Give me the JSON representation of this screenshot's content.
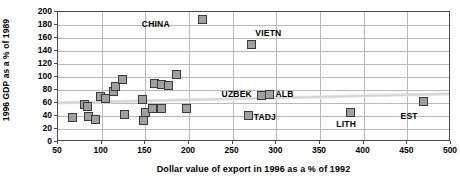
{
  "chart_data": {
    "type": "scatter",
    "title": "",
    "xlabel": "Dollar value of export in 1996 as a % of 1992",
    "ylabel": "1996 GDP as a % of 1989",
    "xlim": [
      50,
      500
    ],
    "ylim": [
      0,
      200
    ],
    "xticks": [
      50,
      100,
      150,
      200,
      250,
      300,
      350,
      400,
      450,
      500
    ],
    "yticks": [
      0,
      20,
      40,
      60,
      80,
      100,
      120,
      140,
      160,
      180,
      200
    ],
    "grid": true,
    "legend": "none",
    "marker": {
      "shape": "square",
      "fill": "#a0a0a0",
      "edge": "#3a3a3a",
      "size": 9
    },
    "points": [
      {
        "x": 67,
        "y": 38,
        "label": ""
      },
      {
        "x": 80,
        "y": 58,
        "label": ""
      },
      {
        "x": 84,
        "y": 54,
        "label": ""
      },
      {
        "x": 85,
        "y": 39,
        "label": ""
      },
      {
        "x": 93,
        "y": 35,
        "label": ""
      },
      {
        "x": 99,
        "y": 70,
        "label": ""
      },
      {
        "x": 104,
        "y": 67,
        "label": ""
      },
      {
        "x": 113,
        "y": 78,
        "label": ""
      },
      {
        "x": 116,
        "y": 85,
        "label": ""
      },
      {
        "x": 124,
        "y": 96,
        "label": ""
      },
      {
        "x": 126,
        "y": 42,
        "label": ""
      },
      {
        "x": 147,
        "y": 65,
        "label": ""
      },
      {
        "x": 148,
        "y": 33,
        "label": ""
      },
      {
        "x": 150,
        "y": 45,
        "label": ""
      },
      {
        "x": 158,
        "y": 51,
        "label": ""
      },
      {
        "x": 161,
        "y": 90,
        "label": ""
      },
      {
        "x": 168,
        "y": 88,
        "label": ""
      },
      {
        "x": 169,
        "y": 52,
        "label": ""
      },
      {
        "x": 176,
        "y": 87,
        "label": ""
      },
      {
        "x": 186,
        "y": 104,
        "label": ""
      },
      {
        "x": 197,
        "y": 52,
        "label": ""
      },
      {
        "x": 215,
        "y": 188,
        "label": "CHINA"
      },
      {
        "x": 268,
        "y": 41,
        "label": "TADJ"
      },
      {
        "x": 272,
        "y": 150,
        "label": "VIETN"
      },
      {
        "x": 283,
        "y": 71,
        "label": "UZBEK"
      },
      {
        "x": 292,
        "y": 73,
        "label": "ALB"
      },
      {
        "x": 385,
        "y": 45,
        "label": "LITH"
      },
      {
        "x": 468,
        "y": 62,
        "label": "EST"
      }
    ],
    "annotations": [
      {
        "text": "CHINA",
        "x": 178,
        "y": 182,
        "anchor": "end"
      },
      {
        "text": "VIETN",
        "x": 276,
        "y": 168,
        "anchor": "start"
      },
      {
        "text": "UZBEK",
        "x": 272,
        "y": 74,
        "anchor": "end"
      },
      {
        "text": "ALB",
        "x": 299,
        "y": 74,
        "anchor": "start"
      },
      {
        "text": "TADJ",
        "x": 274,
        "y": 38,
        "anchor": "start"
      },
      {
        "text": "LITH",
        "x": 380,
        "y": 28,
        "anchor": "middle"
      },
      {
        "text": "EST",
        "x": 452,
        "y": 40,
        "anchor": "middle"
      }
    ],
    "trendline": {
      "type": "linear",
      "color": "#d5d5d5",
      "x0": 50,
      "y0": 58,
      "x1": 500,
      "y1": 72
    }
  }
}
